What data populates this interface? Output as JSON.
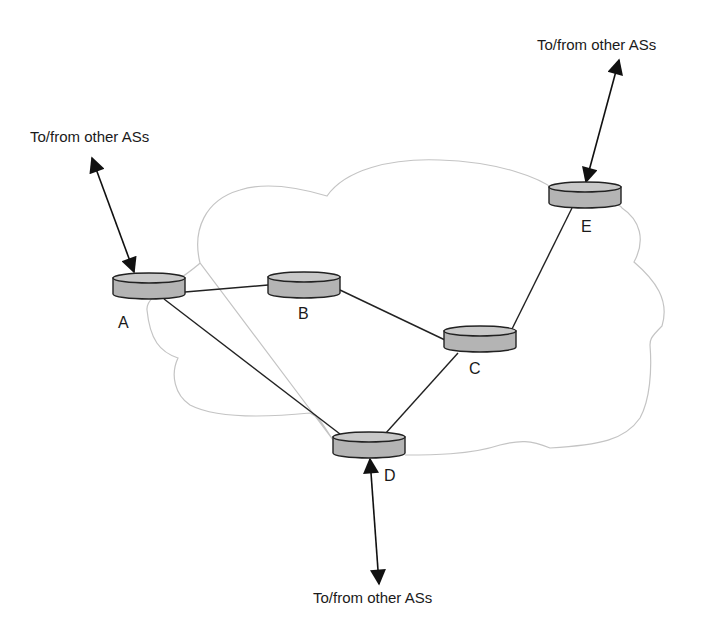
{
  "diagram": {
    "colors": {
      "router_fill": "#b4b4b4",
      "router_top": "#c8c8c8",
      "cloud_outline": "#c4c4c4",
      "line": "#222222",
      "text": "#1a1a1a"
    },
    "routers": [
      {
        "id": "A",
        "label": "A",
        "x": 149,
        "y": 286
      },
      {
        "id": "B",
        "label": "B",
        "x": 304,
        "y": 285
      },
      {
        "id": "C",
        "label": "C",
        "x": 480,
        "y": 339
      },
      {
        "id": "D",
        "label": "D",
        "x": 369,
        "y": 445
      },
      {
        "id": "E",
        "label": "E",
        "x": 585,
        "y": 195
      }
    ],
    "links": [
      {
        "from": "A",
        "to": "B"
      },
      {
        "from": "B",
        "to": "C"
      },
      {
        "from": "C",
        "to": "E"
      },
      {
        "from": "C",
        "to": "D"
      },
      {
        "from": "A",
        "to": "D"
      }
    ],
    "external_links": [
      {
        "router": "A",
        "label": "To/from other ASs",
        "direction": "bidirectional"
      },
      {
        "router": "E",
        "label": "To/from other ASs",
        "direction": "bidirectional"
      },
      {
        "router": "D",
        "label": "To/from other ASs",
        "direction": "bidirectional"
      }
    ],
    "labels": {
      "ext_a": "To/from other ASs",
      "ext_e": "To/from other ASs",
      "ext_d": "To/from other ASs",
      "node_a": "A",
      "node_b": "B",
      "node_c": "C",
      "node_d": "D",
      "node_e": "E"
    }
  }
}
